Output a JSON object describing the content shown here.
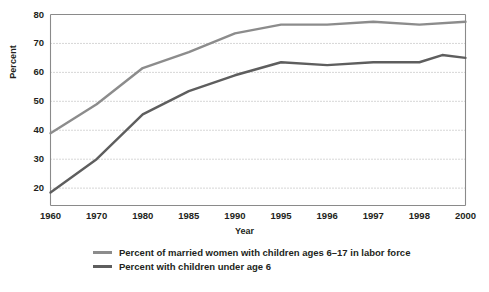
{
  "chart_data": {
    "type": "line",
    "title": "",
    "xlabel": "Year",
    "ylabel": "Percent",
    "categories": [
      "1960",
      "1970",
      "1980",
      "1985",
      "1990",
      "1995",
      "1996",
      "1997",
      "1998",
      "2000"
    ],
    "ytick_labels": [
      "80",
      "70",
      "60",
      "50",
      "40",
      "30",
      "20"
    ],
    "ylim": [
      14,
      80
    ],
    "yticks": [
      20,
      30,
      40,
      50,
      60,
      70,
      80
    ],
    "grid": "horizontal-dotted",
    "legend_position": "bottom-left",
    "series": [
      {
        "name": "Percent of married women with children ages 6–17 in labor force",
        "color": "#8c8c8c",
        "values": [
          39,
          49,
          61.5,
          67,
          73.5,
          76.5,
          76.5,
          77.5,
          76.5,
          77.5
        ]
      },
      {
        "name": "Percent with children under age 6",
        "color": "#5e5e5e",
        "values": [
          18.5,
          30,
          45.5,
          53.5,
          59,
          63.5,
          62.5,
          63.5,
          63.5,
          65
        ]
      }
    ],
    "annotations": [
      {
        "series": 1,
        "x_fraction": 0.944,
        "value": 66,
        "note": "1999 peak between 1998 and 2000"
      }
    ]
  },
  "axes": {
    "y_axis_label": "Percent",
    "x_axis_label": "Year"
  },
  "legend": {
    "items": [
      {
        "label": "Percent of married women with children ages 6–17 in labor force",
        "color": "#8c8c8c"
      },
      {
        "label": "Percent with children under age 6",
        "color": "#5e5e5e"
      }
    ]
  }
}
